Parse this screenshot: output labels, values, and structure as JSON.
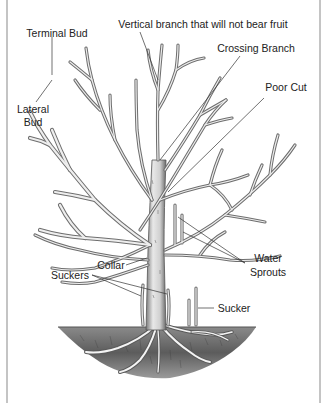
{
  "labels": {
    "vertical_branch": "Vertical branch that will not bear fruit",
    "terminal_bud": "Terminal Bud",
    "crossing_branch": "Crossing Branch",
    "poor_cut": "Poor Cut",
    "lateral_bud_line1": "Lateral",
    "lateral_bud_line2": "Bud",
    "water_sprouts_line1": "Water",
    "water_sprouts_line2": "Sprouts",
    "collar": "Collar",
    "suckers": "Suckers",
    "sucker": "Sucker"
  },
  "colors": {
    "frame": "#c4c4c4",
    "ink": "#222222",
    "soil": "#6a6a6a",
    "bark": "#6e6e6e"
  }
}
